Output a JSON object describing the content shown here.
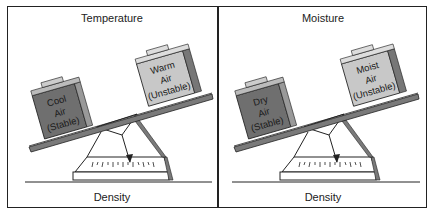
{
  "panels": [
    {
      "title": "Temperature",
      "bottom_label": "Density",
      "left_box": {
        "lines": [
          "Cool",
          "Air",
          "(Stable)"
        ],
        "color": "#6f6f6f"
      },
      "right_box": {
        "lines": [
          "Warm",
          "Air",
          "(Unstable)"
        ],
        "color": "#c8c8c8"
      }
    },
    {
      "title": "Moisture",
      "bottom_label": "Density",
      "left_box": {
        "lines": [
          "Dry",
          "Air",
          "(Stable)"
        ],
        "color": "#6f6f6f"
      },
      "right_box": {
        "lines": [
          "Moist",
          "Air",
          "(Unstable)"
        ],
        "color": "#c8c8c8"
      }
    }
  ],
  "colors": {
    "beam": "#7a7a7a",
    "border": "#222222",
    "background": "#ffffff"
  }
}
